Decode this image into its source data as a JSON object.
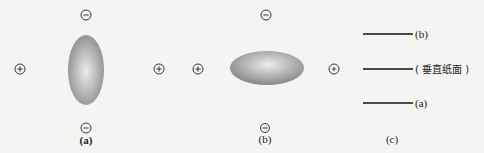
{
  "figure": {
    "panels": [
      {
        "id": "a",
        "label": "(a)",
        "ellipse_orientation": "vertical",
        "charges": {
          "top": "minus",
          "bottom": "minus",
          "left": "plus",
          "right": "plus"
        }
      },
      {
        "id": "b",
        "label": "(b)",
        "ellipse_orientation": "horizontal",
        "charges": {
          "top": "minus",
          "bottom": "minus",
          "left": "plus",
          "right": "plus"
        }
      },
      {
        "id": "c",
        "label": "(c)",
        "lines": [
          {
            "label": "(b)"
          },
          {
            "label": "( 垂直纸面 )"
          },
          {
            "label": "(a)"
          }
        ]
      }
    ],
    "symbols": {
      "plus": "+",
      "minus": "−"
    },
    "colors": {
      "background": "#f4f4f2",
      "ellipse_light": "#e6e6e6",
      "ellipse_dark": "#8a8a8a",
      "stroke": "#222222"
    }
  }
}
